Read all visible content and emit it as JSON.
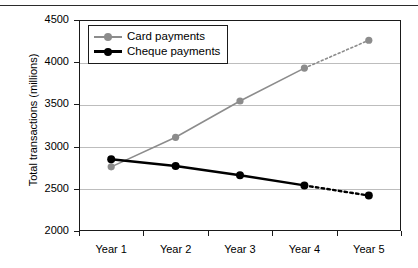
{
  "chart_data": {
    "type": "line",
    "title": "",
    "xlabel": "",
    "ylabel": "Total transactions (millions)",
    "categories": [
      "Year 1",
      "Year 2",
      "Year 3",
      "Year 4",
      "Year 5"
    ],
    "ylim": [
      2000,
      4500
    ],
    "yticks": [
      2000,
      2500,
      3000,
      3500,
      4000,
      4500
    ],
    "ytick_labels": [
      "2000",
      "2500",
      "3000",
      "3500",
      "4000",
      "4500"
    ],
    "grid": true,
    "legend_position": "top-left-inside",
    "series": [
      {
        "name": "Card payments",
        "color": "#8c8c8c",
        "marker": "circle",
        "values": [
          2760,
          3110,
          3540,
          3930,
          4260
        ],
        "solid_through_index": 3,
        "projected_from_index": 3,
        "projected_style": "dotted"
      },
      {
        "name": "Cheque payments",
        "color": "#000000",
        "marker": "circle",
        "values": [
          2850,
          2770,
          2660,
          2540,
          2420
        ],
        "solid_through_index": 3,
        "projected_from_index": 3,
        "projected_style": "dotted"
      }
    ]
  },
  "legend": {
    "items": [
      {
        "label": "Card payments",
        "color": "#8c8c8c"
      },
      {
        "label": "Cheque payments",
        "color": "#000000"
      }
    ]
  },
  "axes": {
    "y_title": "Total transactions (millions)",
    "y_labels": [
      "4500",
      "4000",
      "3500",
      "3000",
      "2500",
      "2000"
    ],
    "x_labels": [
      "Year 1",
      "Year 2",
      "Year 3",
      "Year 4",
      "Year 5"
    ]
  }
}
